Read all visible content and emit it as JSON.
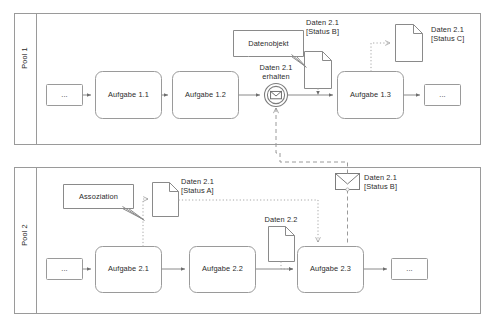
{
  "diagram": {
    "type": "bpmn-collaboration",
    "title": "",
    "colors": {
      "stroke": "#9a9a9a",
      "stroke_dark": "#6e6e6e",
      "text": "#2b2b2b",
      "fill": "#ffffff",
      "pool_header_fill": "#ffffff"
    }
  },
  "pools": [
    {
      "id": "pool1",
      "label": "Pool 1",
      "elements": {
        "start_placeholder": "...",
        "task_1": "Aufgabe 1.1",
        "task_2": "Aufgabe 1.2",
        "event_label_line1": "Daten 2.1",
        "event_label_line2": "erhalten",
        "task_3": "Aufgabe 1.3",
        "end_placeholder": "...",
        "annotation": "Datenobjekt",
        "data_in_line1": "Daten 2.1",
        "data_in_line2": "[Status B]",
        "data_out_line1": "Daten 2.1",
        "data_out_line2": "[Status C]"
      }
    },
    {
      "id": "pool2",
      "label": "Pool 2",
      "elements": {
        "start_placeholder": "...",
        "task_1": "Aufgabe 2.1",
        "task_2": "Aufgabe 2.2",
        "task_3": "Aufgabe 2.3",
        "end_placeholder": "...",
        "annotation": "Assoziation",
        "data_a_line1": "Daten 2.1",
        "data_a_line2": "[Status A]",
        "data_22": "Daten 2.2",
        "message_line1": "Daten 2.1",
        "message_line2": "[Status B]"
      }
    }
  ],
  "icons": {
    "message_catch": "envelope-icon",
    "message_throw": "envelope-icon",
    "data_object": "document-icon",
    "text_annotation": "callout-icon"
  }
}
